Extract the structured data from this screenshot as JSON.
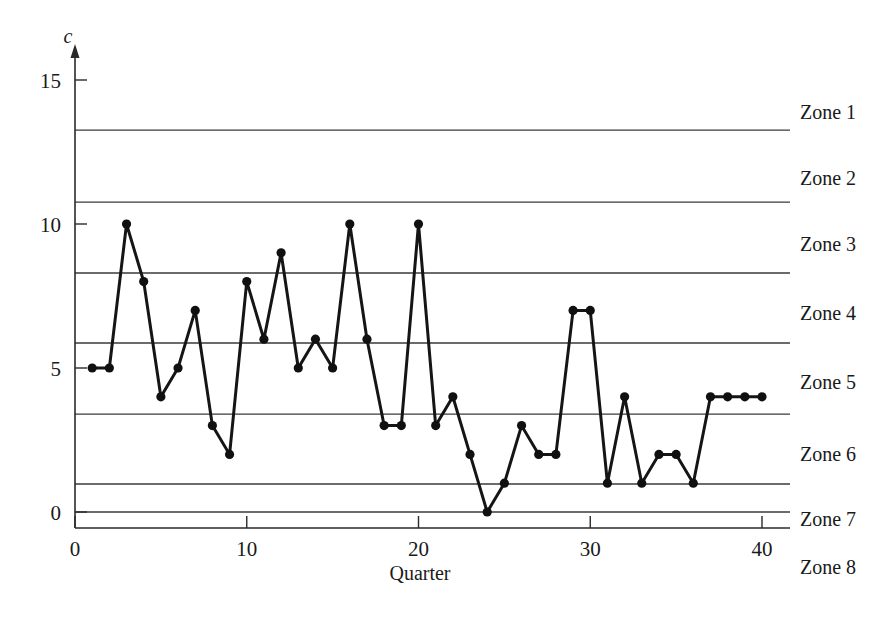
{
  "chart_data": {
    "type": "line",
    "title": "",
    "subtitle": "",
    "xlabel": "Quarter",
    "ylabel": "c",
    "x": [
      1,
      2,
      3,
      4,
      5,
      6,
      7,
      8,
      9,
      10,
      11,
      12,
      13,
      14,
      15,
      16,
      17,
      18,
      19,
      20,
      21,
      22,
      23,
      24,
      25,
      26,
      27,
      28,
      29,
      30,
      31,
      32,
      33,
      34,
      35,
      36,
      37,
      38,
      39,
      40
    ],
    "values": [
      5,
      5,
      10,
      8,
      4,
      5,
      7,
      3,
      2,
      8,
      6,
      9,
      5,
      6,
      5,
      10,
      6,
      3,
      3,
      10,
      3,
      4,
      2,
      0,
      1,
      3,
      2,
      2,
      7,
      7,
      1,
      4,
      1,
      2,
      2,
      1,
      4,
      4,
      4,
      4
    ],
    "series": [
      {
        "name": "c",
        "values": [
          5,
          5,
          10,
          8,
          4,
          5,
          7,
          3,
          2,
          8,
          6,
          9,
          5,
          6,
          5,
          10,
          6,
          3,
          3,
          10,
          3,
          4,
          2,
          0,
          1,
          3,
          2,
          2,
          7,
          7,
          1,
          4,
          1,
          2,
          2,
          1,
          4,
          4,
          4,
          4
        ]
      }
    ],
    "xlim": [
      0,
      40
    ],
    "ylim": [
      0,
      15
    ],
    "x_ticks": [
      0,
      10,
      20,
      30,
      40
    ],
    "x_tick_labels": [
      "0",
      "10",
      "20",
      "30",
      "40"
    ],
    "y_ticks": [
      0,
      5,
      10,
      15
    ],
    "y_tick_labels": [
      "0",
      "5",
      "10",
      "15"
    ],
    "grid": false,
    "legend": "right",
    "marker": "filled-circle",
    "line_color": "#151515",
    "zone_line_color": "#3a3a3a",
    "zone_lines": [
      {
        "label": "Zone 1 upper boundary",
        "value": 13.26
      },
      {
        "label": "Zone 2 upper boundary",
        "value": 10.76
      },
      {
        "label": "Zone 3 upper boundary",
        "value": 8.3
      },
      {
        "label": "Zone 4 upper boundary",
        "value": 5.87
      },
      {
        "label": "Zone 5 upper boundary",
        "value": 3.4
      },
      {
        "label": "Zone 6 upper boundary",
        "value": 0.97
      },
      {
        "label": "Zone 7 upper boundary",
        "value": 0
      }
    ],
    "zone_labels": [
      {
        "label": "Zone 1",
        "y": 13.9
      },
      {
        "label": "Zone 2",
        "y": 11.6
      },
      {
        "label": "Zone 3",
        "y": 9.3
      },
      {
        "label": "Zone 4",
        "y": 6.9
      },
      {
        "label": "Zone 5",
        "y": 4.5
      },
      {
        "label": "Zone 6",
        "y": 2.0
      },
      {
        "label": "Zone 7",
        "y": -0.25
      },
      {
        "label": "Zone 8",
        "y": -1.9
      }
    ]
  }
}
